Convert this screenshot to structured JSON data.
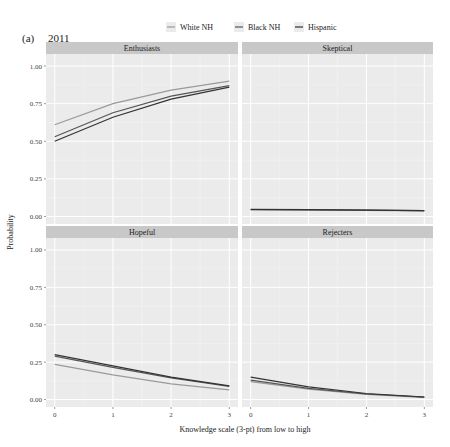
{
  "chart_data": {
    "type": "line",
    "panel_label": "(a)",
    "year_label": "2011",
    "xlabel": "Knowledge scale (3-pt) from low to high",
    "ylabel": "Probability",
    "x": [
      0,
      1,
      2,
      3
    ],
    "x_ticks": [
      "0",
      "1",
      "2",
      "3"
    ],
    "y_ticks": [
      "0.00",
      "0.25",
      "0.50",
      "0.75",
      "1.00"
    ],
    "ylim": [
      -0.05,
      1.08
    ],
    "xlim": [
      -0.15,
      3.15
    ],
    "grid": true,
    "legend": {
      "position": "top",
      "entries": [
        "White NH",
        "Black NH",
        "Hispanic"
      ]
    },
    "series_colors": {
      "White NH": "#9a9a9a",
      "Black NH": "#555555",
      "Hispanic": "#333333"
    },
    "facets": [
      {
        "title": "Enthusiasts",
        "series": [
          {
            "name": "White NH",
            "values": [
              0.61,
              0.75,
              0.84,
              0.9
            ]
          },
          {
            "name": "Black NH",
            "values": [
              0.53,
              0.69,
              0.8,
              0.87
            ]
          },
          {
            "name": "Hispanic",
            "values": [
              0.5,
              0.66,
              0.78,
              0.86
            ]
          }
        ]
      },
      {
        "title": "Skeptical",
        "series": [
          {
            "name": "White NH",
            "values": [
              0.045,
              0.043,
              0.041,
              0.038
            ]
          },
          {
            "name": "Black NH",
            "values": [
              0.046,
              0.044,
              0.042,
              0.039
            ]
          },
          {
            "name": "Hispanic",
            "values": [
              0.047,
              0.045,
              0.042,
              0.039
            ]
          }
        ]
      },
      {
        "title": "Hopeful",
        "series": [
          {
            "name": "White NH",
            "values": [
              0.235,
              0.165,
              0.105,
              0.065
            ]
          },
          {
            "name": "Black NH",
            "values": [
              0.29,
              0.215,
              0.145,
              0.088
            ]
          },
          {
            "name": "Hispanic",
            "values": [
              0.3,
              0.225,
              0.15,
              0.092
            ]
          }
        ]
      },
      {
        "title": "Rejecters",
        "series": [
          {
            "name": "White NH",
            "values": [
              0.12,
              0.07,
              0.035,
              0.015
            ]
          },
          {
            "name": "Black NH",
            "values": [
              0.13,
              0.075,
              0.037,
              0.016
            ]
          },
          {
            "name": "Hispanic",
            "values": [
              0.15,
              0.085,
              0.04,
              0.017
            ]
          }
        ]
      }
    ]
  },
  "caption_text": "Figure 4: Predicted probabilities of science orientation by knowledge and race/ethnicity"
}
